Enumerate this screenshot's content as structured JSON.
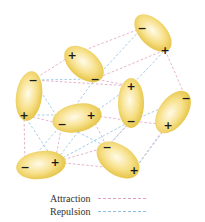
{
  "diagram": {
    "colors": {
      "molecule_fill_outer": "#e6c441",
      "molecule_fill_inner": "#fffbe8",
      "attraction": "#e0a0c0",
      "repulsion": "#8fbfe0"
    },
    "molecules": [
      {
        "id": 1,
        "cx": 153,
        "cy": 33,
        "rx": 23,
        "ry": 13,
        "angle": 45,
        "neg": [
          142,
          28
        ],
        "pos": [
          165,
          50
        ]
      },
      {
        "id": 2,
        "cx": 84,
        "cy": 64,
        "rx": 23,
        "ry": 14,
        "angle": 40,
        "pos": [
          72,
          55
        ],
        "neg": [
          95,
          79
        ]
      },
      {
        "id": 3,
        "cx": 29,
        "cy": 96,
        "rx": 13,
        "ry": 25,
        "angle": 8,
        "neg": [
          33,
          80
        ],
        "pos": [
          24,
          115
        ]
      },
      {
        "id": 4,
        "cx": 77,
        "cy": 118,
        "rx": 25,
        "ry": 14,
        "angle": -12,
        "neg": [
          62,
          124
        ],
        "pos": [
          91,
          115
        ]
      },
      {
        "id": 5,
        "cx": 131,
        "cy": 103,
        "rx": 13,
        "ry": 25,
        "angle": 0,
        "pos": [
          131,
          86
        ],
        "neg": [
          131,
          121
        ]
      },
      {
        "id": 6,
        "cx": 173,
        "cy": 112,
        "rx": 24,
        "ry": 14,
        "angle": -55,
        "neg": [
          186,
          98
        ],
        "pos": [
          168,
          125
        ]
      },
      {
        "id": 7,
        "cx": 41,
        "cy": 165,
        "rx": 25,
        "ry": 14,
        "angle": -8,
        "neg": [
          25,
          167
        ],
        "pos": [
          55,
          162
        ]
      },
      {
        "id": 8,
        "cx": 118,
        "cy": 160,
        "rx": 24,
        "ry": 15,
        "angle": 35,
        "neg": [
          107,
          147
        ],
        "pos": [
          134,
          170
        ]
      }
    ],
    "attraction_lines": [
      [
        72,
        55,
        142,
        28
      ],
      [
        95,
        79,
        165,
        50
      ],
      [
        33,
        80,
        72,
        55
      ],
      [
        24,
        115,
        62,
        124
      ],
      [
        91,
        115,
        131,
        121
      ],
      [
        131,
        86,
        95,
        79
      ],
      [
        131,
        121,
        168,
        125
      ],
      [
        186,
        98,
        165,
        50
      ],
      [
        55,
        162,
        107,
        147
      ],
      [
        24,
        115,
        25,
        167
      ],
      [
        62,
        124,
        55,
        162
      ],
      [
        134,
        170,
        186,
        98
      ],
      [
        33,
        80,
        131,
        86
      ],
      [
        91,
        115,
        107,
        147
      ],
      [
        131,
        121,
        107,
        147
      ],
      [
        55,
        162,
        134,
        170
      ]
    ],
    "repulsion_lines": [
      [
        95,
        79,
        142,
        28
      ],
      [
        33,
        80,
        95,
        79
      ],
      [
        62,
        124,
        95,
        79
      ],
      [
        91,
        115,
        131,
        86
      ],
      [
        131,
        121,
        186,
        98
      ],
      [
        24,
        115,
        91,
        115
      ],
      [
        25,
        167,
        62,
        124
      ],
      [
        55,
        162,
        91,
        115
      ],
      [
        107,
        147,
        131,
        121
      ],
      [
        134,
        170,
        168,
        125
      ],
      [
        131,
        86,
        165,
        50
      ],
      [
        24,
        115,
        55,
        162
      ],
      [
        62,
        124,
        107,
        147
      ],
      [
        33,
        80,
        62,
        124
      ],
      [
        55,
        162,
        131,
        121
      ]
    ]
  },
  "legend": {
    "attraction_label": "Attraction",
    "repulsion_label": "Repulsion"
  },
  "signs": {
    "positive": "+",
    "negative": "−"
  }
}
